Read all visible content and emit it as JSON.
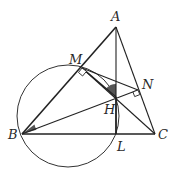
{
  "figure": {
    "type": "geometry",
    "points": [
      {
        "id": "A",
        "label": "A"
      },
      {
        "id": "B",
        "label": "B"
      },
      {
        "id": "C",
        "label": "C"
      },
      {
        "id": "M",
        "label": "M"
      },
      {
        "id": "N",
        "label": "N"
      },
      {
        "id": "H",
        "label": "H"
      },
      {
        "id": "L",
        "label": "L"
      }
    ],
    "segments": [
      "AB",
      "AC",
      "BC",
      "AL",
      "BN",
      "CM",
      "MN",
      "ML"
    ],
    "circle": {
      "through": [
        "B",
        "M",
        "H",
        "L"
      ]
    },
    "right_angles": [
      "M",
      "N"
    ],
    "marked_angles": [
      "ABN",
      "MHA"
    ],
    "colors": {
      "stroke": "#222222",
      "shade": "#555555",
      "background": "#ffffff"
    }
  }
}
